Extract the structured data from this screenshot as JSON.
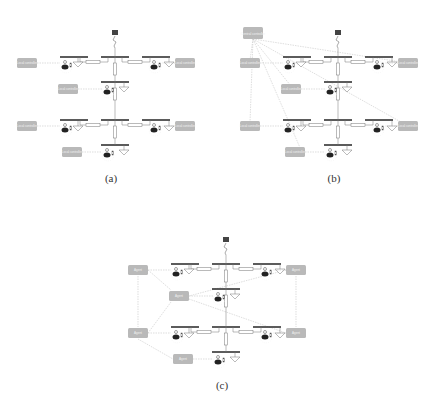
{
  "figure": {
    "panels": [
      {
        "id": "a",
        "caption": "(a)",
        "caption_pos": [
          111,
          180
        ],
        "origin": [
          0,
          0
        ],
        "mode": "decentralized",
        "controller_labels": [
          "Local controller",
          "Local controller",
          "Local controller",
          "Local controller",
          "Local controller",
          "Local controller"
        ],
        "central_label": ""
      },
      {
        "id": "b",
        "caption": "(b)",
        "caption_pos": [
          334,
          180
        ],
        "origin": [
          223,
          0
        ],
        "mode": "centralized",
        "controller_labels": [
          "Local controller",
          "Local controller",
          "Local controller",
          "Local controller",
          "Local controller",
          "Local controller"
        ],
        "central_label": "Central controller"
      },
      {
        "id": "c",
        "caption": "(c)",
        "caption_pos": [
          222,
          387
        ],
        "origin": [
          111,
          207
        ],
        "mode": "distributed",
        "controller_labels": [
          "Agent",
          "Agent",
          "Agent",
          "Agent",
          "Agent",
          "Agent"
        ],
        "central_label": ""
      }
    ],
    "colors": {
      "bus": "#333333",
      "line": "#777777",
      "box_fill": "#b9b9b9",
      "box_text": "#f2f2f2",
      "comm_link": "#c8c8c8"
    }
  }
}
